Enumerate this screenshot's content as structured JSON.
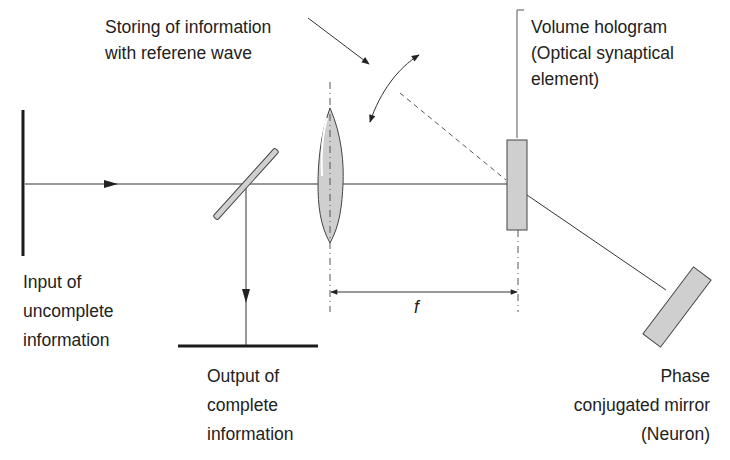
{
  "diagram": {
    "labels": {
      "storing": [
        "Storing of information",
        "with referene wave"
      ],
      "hologram": [
        "Volume hologram",
        "(Optical synaptical",
        "element)"
      ],
      "input": [
        "Input of",
        "uncomplete",
        "information"
      ],
      "output": [
        "Output of",
        "complete",
        "information"
      ],
      "mirror": [
        "Phase",
        "conjugated mirror",
        "(Neuron)"
      ],
      "focal_length": "f"
    },
    "components": [
      {
        "id": "input-screen",
        "name": "Input screen"
      },
      {
        "id": "beam-splitter",
        "name": "Beam splitter"
      },
      {
        "id": "lens",
        "name": "Lens"
      },
      {
        "id": "volume-hologram",
        "name": "Volume hologram"
      },
      {
        "id": "phase-conjugated-mirror",
        "name": "Phase conjugated mirror"
      },
      {
        "id": "output-screen",
        "name": "Output screen"
      }
    ],
    "colors": {
      "line": "#333333",
      "fill": "#cfcfcf",
      "text": "#222222"
    }
  }
}
